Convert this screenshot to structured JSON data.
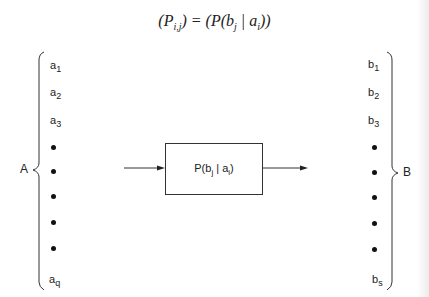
{
  "equation": {
    "lhs": "(P",
    "lhs_sub": "i,j",
    "lhs_close": ")",
    "eq": " = ",
    "rhs_open": "(P(b",
    "rhs_sub1": "j",
    "rhs_mid": " | a",
    "rhs_sub2": "i",
    "rhs_close": "))"
  },
  "input_set": {
    "label": "A",
    "items": [
      {
        "base": "a",
        "sub": "1"
      },
      {
        "base": "a",
        "sub": "2"
      },
      {
        "base": "a",
        "sub": "3"
      },
      {
        "base": "•"
      },
      {
        "base": "•"
      },
      {
        "base": "•"
      },
      {
        "base": "•"
      },
      {
        "base": "•"
      },
      {
        "base": "a",
        "sub": "q"
      }
    ]
  },
  "output_set": {
    "label": "B",
    "items": [
      {
        "base": "b",
        "sub": "1"
      },
      {
        "base": "b",
        "sub": "2"
      },
      {
        "base": "b",
        "sub": "3"
      },
      {
        "base": "•"
      },
      {
        "base": "•"
      },
      {
        "base": "•"
      },
      {
        "base": "•"
      },
      {
        "base": "•"
      },
      {
        "base": "b",
        "sub": "s"
      }
    ]
  },
  "channel_box": {
    "prefix": "P(b",
    "sub1": "j",
    "mid": " | a",
    "sub2": "i",
    "suffix": ")"
  }
}
